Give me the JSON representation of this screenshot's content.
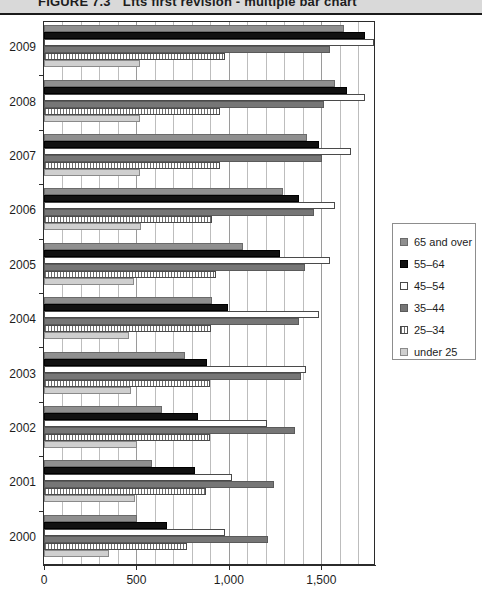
{
  "figure": {
    "number": "FIGURE 7.3",
    "caption": "Lfts first revision - multiple bar chart"
  },
  "legend": {
    "position": "right",
    "items": [
      {
        "label": "65 and over",
        "key": "65_and_over",
        "color": "#8f8f8f",
        "swatch": "solid-gray"
      },
      {
        "label": "55–64",
        "key": "55_64",
        "color": "#111111",
        "swatch": "solid-black"
      },
      {
        "label": "45–54",
        "key": "45_54",
        "color": "#ffffff",
        "swatch": "open-white"
      },
      {
        "label": "35–44",
        "key": "35_44",
        "color": "#767676",
        "swatch": "solid-darkgray"
      },
      {
        "label": "25–34",
        "key": "25_34",
        "color": "#ffffff",
        "swatch": "hatched"
      },
      {
        "label": "under 25",
        "key": "under_25",
        "color": "#cfcfcf",
        "swatch": "light-gray"
      }
    ]
  },
  "axis": {
    "x_ticks": [
      "0",
      "500",
      "1,000",
      "1,500"
    ],
    "x_tick_values": [
      0,
      500,
      1000,
      1500
    ],
    "xlim": [
      0,
      1785
    ],
    "y_categories": [
      "2009",
      "2008",
      "2007",
      "2006",
      "2005",
      "2004",
      "2003",
      "2002",
      "2001",
      "2000"
    ]
  },
  "chart_data": {
    "type": "bar",
    "orientation": "horizontal",
    "xlabel": "",
    "ylabel": "",
    "xlim": [
      0,
      1785
    ],
    "grid": true,
    "legend_position": "right",
    "categories": [
      "2009",
      "2008",
      "2007",
      "2006",
      "2005",
      "2004",
      "2003",
      "2002",
      "2001",
      "2000"
    ],
    "series": [
      {
        "name": "65 and over",
        "color": "#8f8f8f",
        "values": [
          1625,
          1575,
          1425,
          1295,
          1075,
          910,
          765,
          640,
          585,
          505
        ]
      },
      {
        "name": "55–64",
        "color": "#111111",
        "values": [
          1735,
          1640,
          1490,
          1380,
          1275,
          995,
          880,
          835,
          815,
          665
        ]
      },
      {
        "name": "45–54",
        "color": "#ffffff",
        "values": [
          1785,
          1735,
          1660,
          1575,
          1545,
          1490,
          1415,
          1205,
          1015,
          980
        ]
      },
      {
        "name": "35–44",
        "color": "#767676",
        "values": [
          1545,
          1515,
          1505,
          1460,
          1410,
          1380,
          1390,
          1355,
          1245,
          1210
        ]
      },
      {
        "name": "25–34",
        "color": "#ffffff",
        "values": [
          980,
          950,
          950,
          910,
          930,
          905,
          900,
          900,
          875,
          775
        ]
      },
      {
        "name": "under 25",
        "color": "#cfcfcf",
        "values": [
          520,
          520,
          520,
          525,
          485,
          460,
          470,
          505,
          490,
          350
        ]
      }
    ]
  }
}
